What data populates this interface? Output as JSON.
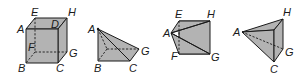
{
  "figures": [
    {
      "name": "cube",
      "labels": {
        "A": "A",
        "B": "B",
        "C": "C",
        "D": "D",
        "E": "E",
        "F": "F",
        "G": "G",
        "H": "H"
      }
    },
    {
      "name": "pyramid-abcg",
      "labels": {
        "A": "A",
        "B": "B",
        "C": "C",
        "G": "G"
      }
    },
    {
      "name": "pyramid-aefgh",
      "labels": {
        "A": "A",
        "E": "E",
        "F": "F",
        "G": "G",
        "H": "H"
      }
    },
    {
      "name": "tetrahedron-acgh",
      "labels": {
        "A": "A",
        "C": "C",
        "G": "G",
        "H": "H"
      }
    }
  ],
  "colors": {
    "fill": "#b3b3b3",
    "stroke": "#1a1a1a",
    "background": "#ffffff"
  }
}
